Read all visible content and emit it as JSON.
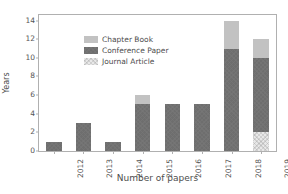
{
  "chart_data": {
    "type": "bar",
    "subtype": "stacked",
    "title": "",
    "xlabel": "Number of papers",
    "ylabel": "Years",
    "categories": [
      "2012",
      "2013",
      "2014",
      "2015",
      "2016",
      "2017",
      "2018",
      "2019"
    ],
    "series": [
      {
        "name": "Journal Article",
        "color": "#e8e8e8",
        "values": [
          0,
          0,
          0,
          0,
          0,
          0,
          0,
          2
        ]
      },
      {
        "name": "Conference Paper",
        "color": "#6e6e6e",
        "values": [
          1,
          3,
          1,
          5,
          5,
          5,
          11,
          8
        ]
      },
      {
        "name": "Chapter Book",
        "color": "#c2c2c2",
        "values": [
          0,
          0,
          0,
          1,
          0,
          0,
          3,
          2
        ]
      }
    ],
    "totals": [
      1,
      3,
      1,
      6,
      5,
      5,
      14,
      12
    ],
    "yticks": [
      0,
      2,
      4,
      6,
      8,
      10,
      12,
      14
    ],
    "ylim": [
      0,
      14.6
    ],
    "grid": false,
    "legend_position": "upper left",
    "xtick_rotation": -90
  },
  "legend": {
    "items": [
      {
        "label": "Chapter Book",
        "key": "chapter"
      },
      {
        "label": "Conference Paper",
        "key": "conference"
      },
      {
        "label": "Journal Article",
        "key": "journal"
      }
    ]
  },
  "colors": {
    "chapter": "#c2c2c2",
    "conference": "#6e6e6e",
    "journal": "#e8e8e8",
    "axis": "#b0b0b0",
    "text": "#4d4d4d",
    "background": "#ffffff"
  }
}
